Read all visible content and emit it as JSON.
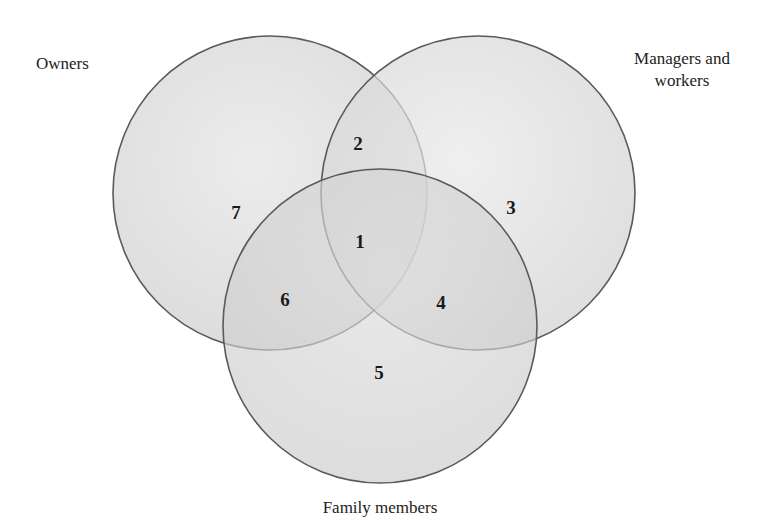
{
  "diagram": {
    "type": "venn",
    "sets": [
      {
        "id": "owners",
        "label": "Owners",
        "cx": 270,
        "cy": 193,
        "r": 157
      },
      {
        "id": "managers",
        "label": "Managers and workers",
        "label_lines": [
          "Managers and",
          "workers"
        ],
        "cx": 478,
        "cy": 193,
        "r": 157
      },
      {
        "id": "family",
        "label": "Family members",
        "cx": 380,
        "cy": 326,
        "r": 157
      }
    ],
    "regions": [
      {
        "number": "1",
        "sets": [
          "owners",
          "managers",
          "family"
        ],
        "x": 360,
        "y": 244
      },
      {
        "number": "2",
        "sets": [
          "owners",
          "managers"
        ],
        "x": 358,
        "y": 146
      },
      {
        "number": "3",
        "sets": [
          "managers"
        ],
        "x": 511,
        "y": 210
      },
      {
        "number": "4",
        "sets": [
          "managers",
          "family"
        ],
        "x": 441,
        "y": 305
      },
      {
        "number": "5",
        "sets": [
          "family"
        ],
        "x": 379,
        "y": 375
      },
      {
        "number": "6",
        "sets": [
          "owners",
          "family"
        ],
        "x": 285,
        "y": 302
      },
      {
        "number": "7",
        "sets": [
          "owners"
        ],
        "x": 236,
        "y": 215
      }
    ],
    "colors": {
      "fill": "#d6d6d6",
      "stroke": "#5a5a5a",
      "text": "#1a1a1a"
    }
  }
}
